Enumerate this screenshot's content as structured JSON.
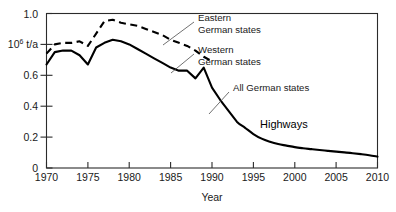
{
  "chart_data": {
    "type": "line",
    "title": "",
    "xlabel": "Year",
    "ylabel": "10^6 t/a",
    "ylabel_mantissa": "10",
    "ylabel_exponent": "6",
    "ylabel_unit": " t/a",
    "xlim": [
      1969,
      2010.5
    ],
    "ylim": [
      0,
      1.0
    ],
    "grid": false,
    "legend_position": "inline-annotations",
    "xticks": [
      1970,
      1975,
      1980,
      1985,
      1990,
      1995,
      2000,
      2005,
      2010
    ],
    "xtick_labels": [
      "1970",
      "1975",
      "1980",
      "1985",
      "1990",
      "1995",
      "2000",
      "2005",
      "2010"
    ],
    "yticks": [
      0,
      0.2,
      0.4,
      0.6,
      0.8,
      1.0
    ],
    "ytick_labels": [
      "0",
      "0.2",
      "0.4",
      "0.6",
      "0.8",
      "1.0"
    ],
    "ytick_label_overrides": {
      "0.8": "10^6 t/a"
    },
    "series": [
      {
        "name": "Eastern German states",
        "style": "dashed",
        "color": "#000000",
        "x": [
          1970,
          1971,
          1972,
          1973,
          1974,
          1975,
          1976,
          1977,
          1978,
          1979,
          1980,
          1981,
          1982,
          1983,
          1984,
          1985,
          1986,
          1987,
          1988,
          1989,
          1990
        ],
        "values": [
          0.74,
          0.8,
          0.81,
          0.81,
          0.82,
          0.79,
          0.87,
          0.95,
          0.96,
          0.94,
          0.93,
          0.92,
          0.9,
          0.88,
          0.86,
          0.83,
          0.81,
          0.79,
          0.76,
          0.72,
          0.69
        ]
      },
      {
        "name": "Western German states / All German states",
        "style": "solid",
        "color": "#000000",
        "x": [
          1970,
          1971,
          1972,
          1973,
          1974,
          1975,
          1976,
          1977,
          1978,
          1979,
          1980,
          1981,
          1982,
          1983,
          1984,
          1985,
          1986,
          1987,
          1988,
          1989,
          1990,
          1991,
          1992,
          1993,
          1994,
          1995,
          1996,
          1997,
          1998,
          1999,
          2000,
          2001,
          2002,
          2003,
          2004,
          2005,
          2006,
          2007,
          2008,
          2009,
          2010
        ],
        "values": [
          0.67,
          0.75,
          0.76,
          0.76,
          0.73,
          0.67,
          0.78,
          0.81,
          0.83,
          0.82,
          0.8,
          0.77,
          0.74,
          0.71,
          0.68,
          0.65,
          0.63,
          0.63,
          0.58,
          0.65,
          0.52,
          0.44,
          0.37,
          0.3,
          0.26,
          0.22,
          0.19,
          0.17,
          0.155,
          0.145,
          0.135,
          0.128,
          0.122,
          0.116,
          0.111,
          0.106,
          0.101,
          0.096,
          0.09,
          0.083,
          0.074
        ]
      }
    ],
    "annotations": [
      {
        "id": "eastern",
        "text_line1": "Eastern",
        "text_line2": "German states"
      },
      {
        "id": "western",
        "text_line1": "Western",
        "text_line2": "German states"
      },
      {
        "id": "all",
        "text_line1": "All German states",
        "text_line2": ""
      },
      {
        "id": "highways",
        "text_line1": "Highways",
        "text_line2": ""
      }
    ]
  }
}
